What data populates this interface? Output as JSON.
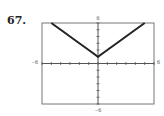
{
  "problem_number": "67.",
  "chart_data": {
    "type": "line",
    "title": "",
    "xlabel": "",
    "ylabel": "",
    "xlim": [
      -6,
      6
    ],
    "ylim": [
      -6,
      6
    ],
    "grid": false,
    "legend": null,
    "tick_labels": {
      "x_min": "−6",
      "x_max": "6",
      "y_min": "−6",
      "y_max": "6"
    },
    "x_ticks": [
      -6,
      -5,
      -4,
      -3,
      -2,
      -1,
      0,
      1,
      2,
      3,
      4,
      5,
      6
    ],
    "y_ticks": [
      -6,
      -5,
      -4,
      -3,
      -2,
      -1,
      0,
      1,
      2,
      3,
      4,
      5,
      6
    ],
    "series": [
      {
        "name": "y = |x| + 1",
        "x": [
          -5,
          -4,
          -3,
          -2,
          -1,
          0,
          1,
          2,
          3,
          4,
          5
        ],
        "y": [
          6,
          5,
          4,
          3,
          2,
          1,
          2,
          3,
          4,
          5,
          6
        ]
      }
    ],
    "colors": {
      "curve": "#222222",
      "frame": "#777777",
      "axis": "#555555"
    }
  }
}
